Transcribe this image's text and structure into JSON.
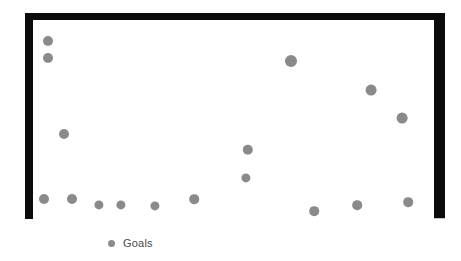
{
  "chart_data": {
    "type": "scatter",
    "title": "",
    "subtitle": "",
    "xlabel": "",
    "ylabel": "",
    "grid": false,
    "legend_position": "bottom-left",
    "axis": {
      "xlim": [
        0,
        18
      ],
      "ylim": [
        0,
        9
      ],
      "x_ticks": [],
      "y_ticks": [],
      "x_tick_labels": [],
      "y_tick_labels": []
    },
    "series": [
      {
        "name": "Goals",
        "color": "#8a8a8a",
        "marker": "circle",
        "points": [
          {
            "x": 1,
            "y": 8.0
          },
          {
            "x": 1,
            "y": 7.3
          },
          {
            "x": 2,
            "y": 3.9
          },
          {
            "x": 1,
            "y": 0.9
          },
          {
            "x": 2,
            "y": 0.9
          },
          {
            "x": 3,
            "y": 0.6
          },
          {
            "x": 4,
            "y": 0.6
          },
          {
            "x": 5,
            "y": 0.6
          },
          {
            "x": 6,
            "y": 0.9
          },
          {
            "x": 10,
            "y": 3.2
          },
          {
            "x": 10,
            "y": 1.9
          },
          {
            "x": 12,
            "y": 7.2
          },
          {
            "x": 13,
            "y": 0.3
          },
          {
            "x": 15,
            "y": 0.6
          },
          {
            "x": 15,
            "y": 6.0
          },
          {
            "x": 17,
            "y": 4.8
          },
          {
            "x": 17,
            "y": 0.8
          }
        ]
      }
    ],
    "pixel_points": [
      {
        "x": 48,
        "y": 41,
        "r": 5.0
      },
      {
        "x": 48,
        "y": 58,
        "r": 5.0
      },
      {
        "x": 64,
        "y": 134,
        "r": 5.0
      },
      {
        "x": 44,
        "y": 199,
        "r": 5.0
      },
      {
        "x": 72,
        "y": 199,
        "r": 5.0
      },
      {
        "x": 99,
        "y": 205,
        "r": 4.6
      },
      {
        "x": 121,
        "y": 205,
        "r": 4.6
      },
      {
        "x": 155,
        "y": 206,
        "r": 4.6
      },
      {
        "x": 194,
        "y": 199,
        "r": 4.8
      },
      {
        "x": 248,
        "y": 150,
        "r": 5.2
      },
      {
        "x": 246,
        "y": 178,
        "r": 4.6
      },
      {
        "x": 291,
        "y": 61,
        "r": 6.0
      },
      {
        "x": 314,
        "y": 211,
        "r": 4.8
      },
      {
        "x": 357,
        "y": 205,
        "r": 4.8
      },
      {
        "x": 371,
        "y": 90,
        "r": 5.4
      },
      {
        "x": 402,
        "y": 118,
        "r": 5.4
      },
      {
        "x": 408,
        "y": 202,
        "r": 4.8
      }
    ]
  },
  "legend": {
    "label": "Goals",
    "marker_color": "#8a8a8a"
  },
  "colors": {
    "frame": "#0b0b0b",
    "marker": "#8a8a8a",
    "baseline": "#c9c9c9",
    "background": "#ffffff",
    "legend_text": "#4a4a4a"
  }
}
